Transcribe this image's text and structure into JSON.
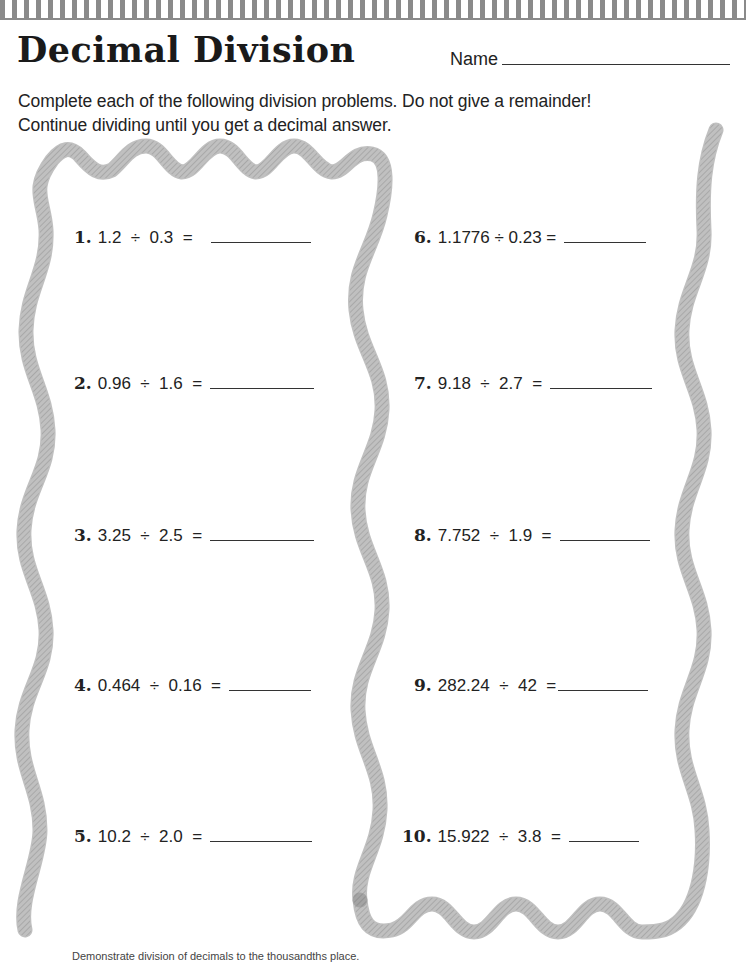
{
  "header": {
    "title": "Decimal Division",
    "name_label": "Name"
  },
  "instructions": {
    "line1": "Complete each of the following division problems. Do not give a remainder!",
    "line2": "Continue dividing until you get a decimal answer."
  },
  "problems": [
    {
      "number": "1.",
      "expression": "1.2  ÷  0.3  ="
    },
    {
      "number": "2.",
      "expression": "0.96  ÷  1.6  ="
    },
    {
      "number": "3.",
      "expression": "3.25  ÷  2.5  ="
    },
    {
      "number": "4.",
      "expression": "0.464  ÷  0.16  ="
    },
    {
      "number": "5.",
      "expression": "10.2  ÷  2.0  ="
    },
    {
      "number": "6.",
      "expression": "1.1776 ÷ 0.23 ="
    },
    {
      "number": "7.",
      "expression": "9.18  ÷  2.7  ="
    },
    {
      "number": "8.",
      "expression": "7.752  ÷  1.9  ="
    },
    {
      "number": "9.",
      "expression": "282.24  ÷  42  ="
    },
    {
      "number": "10.",
      "expression": "15.922  ÷  3.8  ="
    }
  ],
  "footer": {
    "text": "Demonstrate division of decimals to the thousandths place."
  },
  "colors": {
    "stripe": "#8a8a8a",
    "rope": "#9a9a9a",
    "text": "#222222"
  }
}
